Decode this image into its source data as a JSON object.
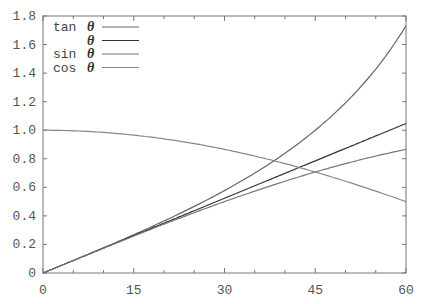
{
  "chart_data": {
    "type": "line",
    "title": "",
    "xlabel": "",
    "ylabel": "",
    "xlim": [
      0,
      60
    ],
    "ylim": [
      0,
      1.8
    ],
    "grid": false,
    "legend_position": "upper-left",
    "x_ticks": [
      "0",
      "15",
      "30",
      "45",
      "60"
    ],
    "y_ticks": [
      "0",
      "0.2",
      "0.4",
      "0.6",
      "0.8",
      "1.0",
      "1.2",
      "1.4",
      "1.6",
      "1.8"
    ],
    "x": [
      0,
      5,
      10,
      15,
      20,
      25,
      30,
      35,
      40,
      45,
      50,
      55,
      60
    ],
    "series": [
      {
        "name": "tan θ",
        "color": "#666666",
        "values": [
          0,
          0.087,
          0.176,
          0.268,
          0.364,
          0.466,
          0.577,
          0.7,
          0.839,
          1.0,
          1.192,
          1.428,
          1.732
        ]
      },
      {
        "name": "θ",
        "color": "#333333",
        "values": [
          0,
          0.087,
          0.175,
          0.262,
          0.349,
          0.436,
          0.524,
          0.611,
          0.698,
          0.785,
          0.873,
          0.96,
          1.047
        ]
      },
      {
        "name": "sin θ",
        "color": "#777777",
        "values": [
          0,
          0.087,
          0.174,
          0.259,
          0.342,
          0.423,
          0.5,
          0.574,
          0.643,
          0.707,
          0.766,
          0.819,
          0.866
        ]
      },
      {
        "name": "cos θ",
        "color": "#888888",
        "values": [
          1.0,
          0.996,
          0.985,
          0.966,
          0.94,
          0.906,
          0.866,
          0.819,
          0.766,
          0.707,
          0.643,
          0.574,
          0.5
        ]
      }
    ]
  },
  "legend": [
    {
      "prefix": "tan",
      "symbol": "θ"
    },
    {
      "prefix": "",
      "symbol": "θ"
    },
    {
      "prefix": "sin",
      "symbol": "θ"
    },
    {
      "prefix": "cos",
      "symbol": "θ"
    }
  ]
}
